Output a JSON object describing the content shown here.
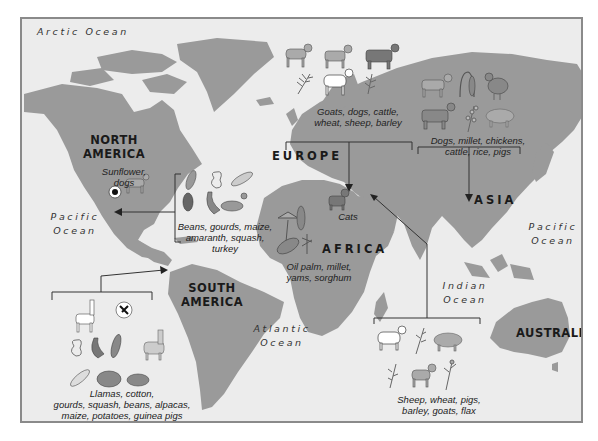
{
  "oceans": {
    "arctic": "Arctic Ocean",
    "pacific_west": [
      "Pacific",
      "Ocean"
    ],
    "atlantic": [
      "Atlantic",
      "Ocean"
    ],
    "indian": [
      "Indian",
      "Ocean"
    ],
    "pacific_east": [
      "Pacific",
      "Ocean"
    ]
  },
  "continents": {
    "north_america": [
      "NORTH",
      "AMERICA"
    ],
    "south_america": [
      "SOUTH",
      "AMERICA"
    ],
    "europe": "EUROPE",
    "africa": "AFRICA",
    "asia": "ASIA",
    "australia": "AUSTRALIA"
  },
  "domestication_centers": {
    "north_america": {
      "caption": [
        "Sunflower,",
        "dogs"
      ],
      "icons": [
        "sunflower-icon",
        "dog-icon"
      ]
    },
    "mesoamerica": {
      "caption": [
        "Beans, gourds, maize,",
        "amaranth, squash,",
        "turkey"
      ],
      "icons": [
        "beans-icon",
        "gourd-icon",
        "maize-icon",
        "amaranth-icon",
        "squash-icon",
        "turkey-icon"
      ]
    },
    "south_america": {
      "caption": [
        "Llamas, cotton,",
        "gourds, squash, beans, alpacas,",
        "maize, potatoes, guinea pigs"
      ],
      "icons": [
        "llama-icon",
        "cotton-icon",
        "gourd-icon",
        "squash-icon",
        "beans-icon",
        "alpaca-icon",
        "maize-icon",
        "potato-icon",
        "guinea-pig-icon"
      ]
    },
    "europe": {
      "caption": [
        "Goats, dogs, cattle,",
        "wheat, sheep, barley"
      ],
      "icons": [
        "goat-icon",
        "dog-icon",
        "cattle-icon",
        "wheat-icon",
        "sheep-icon",
        "barley-icon"
      ]
    },
    "africa_north": {
      "caption": [
        "Cats"
      ],
      "icons": [
        "cat-icon"
      ]
    },
    "africa_west": {
      "caption": [
        "Oil palm, millet,",
        "yams, sorghum"
      ],
      "icons": [
        "oil-palm-icon",
        "millet-icon",
        "yam-icon",
        "sorghum-icon"
      ]
    },
    "asia": {
      "caption": [
        "Dogs, millet, chickens,",
        "cattle, rice, pigs"
      ],
      "icons": [
        "dog-icon",
        "millet-icon",
        "chicken-icon",
        "cattle-icon",
        "rice-icon",
        "pig-icon"
      ]
    },
    "fertile_crescent": {
      "caption": [
        "Sheep, wheat, pigs,",
        "barley, goats, flax"
      ],
      "icons": [
        "sheep-icon",
        "wheat-icon",
        "pig-icon",
        "barley-icon",
        "goat-icon",
        "flax-icon"
      ]
    }
  },
  "colors": {
    "ocean": "#ececec",
    "land": "#9a9a9a",
    "frame": "#8a8a8a",
    "line": "#333333"
  }
}
